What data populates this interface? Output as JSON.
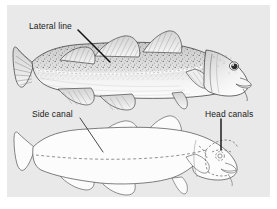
{
  "figure": {
    "panel_background_color": "#e9e9e9",
    "page_background_color": "#ffffff",
    "ink_color": "#333333",
    "label_text_color": "#1a1a1a",
    "leader_line_color": "#111111"
  },
  "labels": {
    "lateral_line": "Lateral line",
    "side_canal": "Side canal",
    "head_canals": "Head canals"
  },
  "illustrations": [
    {
      "id": "upper-fish",
      "name": "shaded-cod-illustration",
      "style": "detailed stippled and hatched pen drawing",
      "features": [
        "three dorsal fins",
        "two anal fins",
        "pectoral fin",
        "pelvic fin",
        "forked caudal fin",
        "chin barbel",
        "dark eye",
        "speckled dorsal surface",
        "pale lateral line stripe"
      ],
      "callouts": [
        "lateral_line"
      ]
    },
    {
      "id": "lower-fish",
      "name": "outline-cod-illustration",
      "style": "plain outline drawing with dashed sensory canals",
      "features": [
        "three dorsal fins",
        "two anal fins",
        "pectoral fin",
        "pelvic fin",
        "forked caudal fin",
        "chin barbel",
        "dashed head canal network",
        "dashed side canal along flank"
      ],
      "callouts": [
        "side_canal",
        "head_canals"
      ]
    }
  ]
}
